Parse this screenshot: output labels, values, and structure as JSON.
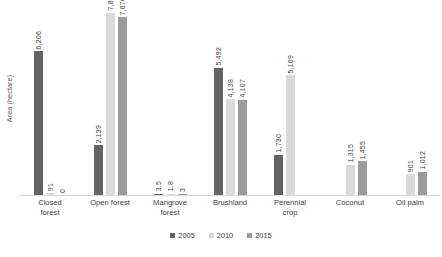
{
  "chart_data": {
    "type": "bar",
    "title": "",
    "subtitle": "",
    "xlabel": "",
    "ylabel": "Area (hectare)",
    "ylim": [
      0,
      8200
    ],
    "grid": false,
    "legend_position": "bottom-center",
    "categories": [
      "Closed forest",
      "Open forest",
      "Mangrove forest",
      "Brushland",
      "Perennial crop",
      "Coconut",
      "Oil palm"
    ],
    "series": [
      {
        "name": "2005",
        "color": "#636363",
        "values": [
          6206,
          2139,
          3.5,
          5492,
          1730,
          null,
          null
        ],
        "labels": [
          "6,206",
          "2,139",
          "3.5",
          "5,492",
          "1,730",
          "",
          ""
        ]
      },
      {
        "name": "2010",
        "color": "#d9d9d9",
        "values": [
          91,
          7872,
          1.8,
          4138,
          5169,
          1315,
          901
        ],
        "labels": [
          "91",
          "7,872",
          "1.8",
          "4,138",
          "5,169",
          "1,315",
          "901"
        ]
      },
      {
        "name": "2015",
        "color": "#9c9c9c",
        "values": [
          0,
          7670,
          3,
          4107,
          null,
          1455,
          1012
        ],
        "labels": [
          "0",
          "7,670",
          "3",
          "4,107",
          "",
          "1,455",
          "1,012"
        ]
      }
    ]
  },
  "axis": {
    "y_title": "Area (hectare)"
  },
  "categories": [
    {
      "line1": "Closed",
      "line2": "forest"
    },
    {
      "line1": "Open forest",
      "line2": ""
    },
    {
      "line1": "Mangrove",
      "line2": "forest"
    },
    {
      "line1": "Brushland",
      "line2": ""
    },
    {
      "line1": "Perennial",
      "line2": "crop"
    },
    {
      "line1": "Coconut",
      "line2": ""
    },
    {
      "line1": "Oil palm",
      "line2": ""
    }
  ],
  "legend": {
    "items": [
      {
        "label": "2005",
        "color": "#636363"
      },
      {
        "label": "2010",
        "color": "#d9d9d9"
      },
      {
        "label": "2015",
        "color": "#9c9c9c"
      }
    ]
  }
}
